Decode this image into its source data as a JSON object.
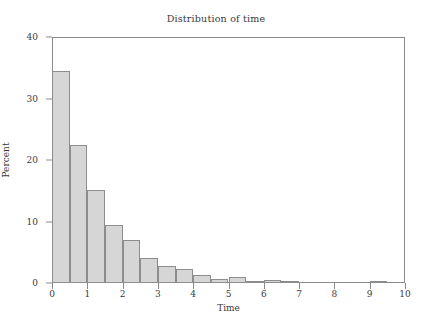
{
  "chart_data": {
    "type": "bar",
    "title": "Distribution of time",
    "xlabel": "Time",
    "ylabel": "Percent",
    "xlim": [
      0,
      10
    ],
    "ylim": [
      0,
      40
    ],
    "xticks": [
      0,
      1,
      2,
      3,
      4,
      5,
      6,
      7,
      8,
      9,
      10
    ],
    "yticks": [
      0,
      10,
      20,
      30,
      40
    ],
    "grid": false,
    "legend": false,
    "bin_width": 0.5,
    "bar_fill_color": "#d6d6d6",
    "bar_edge_color": "#8d8d8d",
    "frame_color": "#8a8a8a",
    "categories": [
      "0.0-0.5",
      "0.5-1.0",
      "1.0-1.5",
      "1.5-2.0",
      "2.0-2.5",
      "2.5-3.0",
      "3.0-3.5",
      "3.5-4.0",
      "4.0-4.5",
      "4.5-5.0",
      "5.0-5.5",
      "5.5-6.0",
      "6.0-6.5",
      "6.5-7.0",
      "7.0-7.5",
      "7.5-8.0",
      "8.0-8.5",
      "8.5-9.0",
      "9.0-9.5",
      "9.5-10.0"
    ],
    "bin_starts": [
      0,
      0.5,
      1,
      1.5,
      2,
      2.5,
      3,
      3.5,
      4,
      4.5,
      5,
      5.5,
      6,
      6.5,
      7,
      7.5,
      8,
      8.5,
      9,
      9.5
    ],
    "values": [
      34.5,
      22.4,
      15.1,
      9.4,
      7.0,
      4.1,
      2.8,
      2.2,
      1.3,
      0.6,
      0.9,
      0.1,
      0.5,
      0.1,
      0.0,
      0.0,
      0.0,
      0.0,
      0.3,
      0.0
    ]
  },
  "axis": {
    "y_tick_labels": [
      "0",
      "10",
      "20",
      "30",
      "40"
    ],
    "x_tick_labels": [
      "0",
      "1",
      "2",
      "3",
      "4",
      "5",
      "6",
      "7",
      "8",
      "9",
      "10"
    ]
  }
}
